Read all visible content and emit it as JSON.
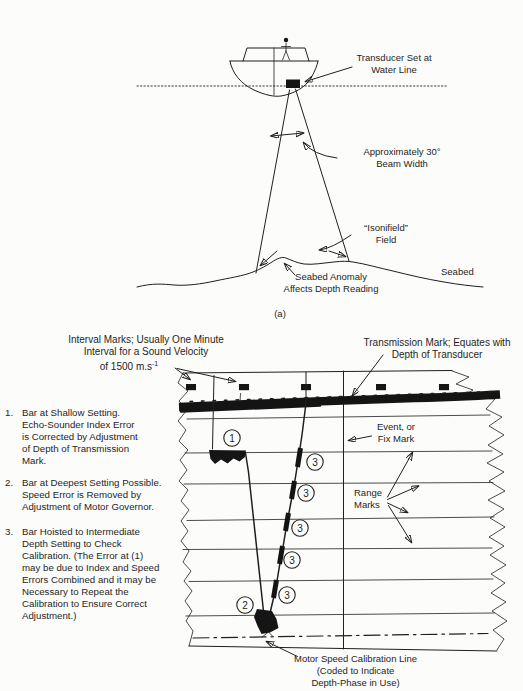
{
  "page": {
    "paper_color": "#fcfcfa",
    "ink_color": "#1f1f1f"
  },
  "part_a": {
    "caption": "(a)",
    "transducer_label": {
      "line1": "Transducer Set at",
      "line2": "Water Line"
    },
    "beam_label": {
      "line1": "Approximately 30°",
      "line2": "Beam Width"
    },
    "isonifield_label": {
      "line1": "“Isonifield”",
      "line2": "Field"
    },
    "anomaly_label": {
      "line1": "Seabed Anomaly",
      "line2": "Affects Depth Reading"
    },
    "seabed_label": "Seabed"
  },
  "part_b": {
    "interval_label": {
      "line1": "Interval Marks; Usually One Minute",
      "line2": "Interval for a Sound Velocity",
      "line3": "of 1500 m.s",
      "superscript": "-1"
    },
    "transmission_label": {
      "line1": "Transmission Mark; Equates with",
      "line2": "Depth of Transducer"
    },
    "event_label": {
      "line1": "Event, or",
      "line2": "Fix Mark"
    },
    "range_label": {
      "line1": "Range",
      "line2": "Marks"
    },
    "motor_label": {
      "line1": "Motor Speed Calibration Line",
      "line2": "(Coded to Indicate",
      "line3": "Depth-Phase in Use)"
    },
    "callouts": {
      "shallow": "1",
      "deep": "2",
      "intermediate": "3"
    },
    "notes": [
      {
        "num": "1.",
        "lines": [
          "Bar at Shallow Setting.",
          "Echo-Sounder Index Error",
          "is Corrected by Adjustment",
          "of Depth of Transmission",
          "Mark."
        ]
      },
      {
        "num": "2.",
        "lines": [
          "Bar at Deepest Setting Possible.",
          "Speed Error is Removed by",
          "Adjustment of Motor Governor."
        ]
      },
      {
        "num": "3.",
        "lines": [
          "Bar Hoisted to Intermediate",
          "Depth Setting to Check",
          "Calibration. (The Error at (1)",
          "may be due to Index and Speed",
          "Errors Combined and it may be",
          "Necessary to Repeat the",
          "Calibration to Ensure Correct",
          "Adjustment.)"
        ]
      }
    ]
  }
}
